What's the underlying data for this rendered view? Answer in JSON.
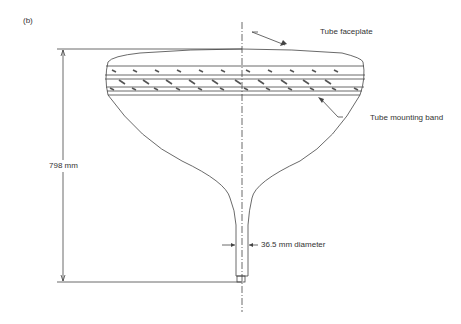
{
  "panel_label": "(b)",
  "labels": {
    "faceplate": "Tube faceplate",
    "mounting_band": "Tube mounting band",
    "height": "798 mm",
    "neck_diameter": "36.5 mm diameter"
  },
  "colors": {
    "line": "#444444",
    "text": "#333333"
  }
}
